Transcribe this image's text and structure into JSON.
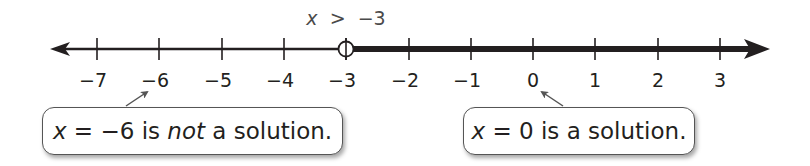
{
  "figure": {
    "type": "number-line",
    "inequality_label": {
      "variable": "x",
      "operator": ">",
      "value": "−3",
      "text": "x > −3"
    },
    "axis": {
      "min_tick": -7,
      "max_tick": 3,
      "tick_labels": [
        "−7",
        "−6",
        "−5",
        "−4",
        "−3",
        "−2",
        "−1",
        "0",
        "1",
        "2",
        "3"
      ],
      "arrows": [
        "left",
        "right"
      ],
      "color": "#231f20"
    },
    "solution_set": {
      "boundary": -3,
      "boundary_marker": "open-circle",
      "direction": "right",
      "shaded_color": "#231f20"
    },
    "callouts": [
      {
        "id": "left",
        "points_to": -6,
        "parts": [
          {
            "text": "x",
            "style": "italic"
          },
          {
            "text": " = −6 is ",
            "style": "normal"
          },
          {
            "text": "not",
            "style": "italic"
          },
          {
            "text": " a solution.",
            "style": "normal"
          }
        ],
        "full_text": "x = −6 is not a solution."
      },
      {
        "id": "right",
        "points_to": 0,
        "parts": [
          {
            "text": "x",
            "style": "italic"
          },
          {
            "text": " = 0 is a solution.",
            "style": "normal"
          }
        ],
        "full_text": "x = 0 is a solution."
      }
    ]
  }
}
